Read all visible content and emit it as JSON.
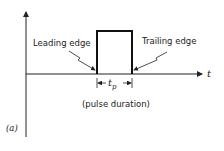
{
  "figure": {
    "panel_label": "(a)",
    "axis_label_t": "t",
    "leading_edge_label": "Leading edge",
    "trailing_edge_label": "Trailing edge",
    "pulse_width_symbol": "t",
    "pulse_width_subscript": "p",
    "pulse_width_caption": "(pulse duration)"
  },
  "colors": {
    "stroke": "#222222",
    "background": "#ffffff"
  }
}
